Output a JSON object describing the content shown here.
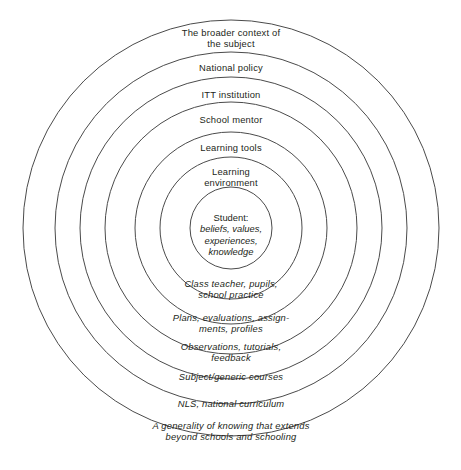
{
  "diagram": {
    "type": "concentric-circles",
    "stroke_color": "#4b4b4b",
    "text_color": "#231f20",
    "background_color": "#ffffff",
    "center": {
      "x": 231,
      "y": 228
    },
    "core": {
      "title": "Student:",
      "detail": "beliefs, values,\nexperiences,\nknowledge",
      "radius": 41,
      "label_x": 231,
      "label_y": 212
    },
    "rings": [
      {
        "index": 1,
        "radius": 71,
        "top_label": "Learning\nenvironment",
        "bottom_label": "Class teacher, pupils,\nschool practice",
        "top_x": 231,
        "top_y": 166,
        "bottom_x": 231,
        "bottom_y": 278
      },
      {
        "index": 2,
        "radius": 96,
        "top_label": "Learning tools",
        "bottom_label": "Plans, evaluations, assign-\nments, profiles",
        "top_x": 231,
        "top_y": 142,
        "bottom_x": 231,
        "bottom_y": 312
      },
      {
        "index": 3,
        "radius": 126,
        "top_label": "School mentor",
        "bottom_label": "Observations, tutorials,\nfeedback",
        "top_x": 231,
        "top_y": 114,
        "bottom_x": 231,
        "bottom_y": 341
      },
      {
        "index": 4,
        "radius": 151,
        "top_label": "ITT institution",
        "bottom_label": "Subject/generic courses",
        "top_x": 231,
        "top_y": 89,
        "bottom_x": 231,
        "bottom_y": 371
      },
      {
        "index": 5,
        "radius": 176,
        "top_label": "National policy",
        "bottom_label": "NLS, national curriculum",
        "top_x": 231,
        "top_y": 62,
        "bottom_x": 231,
        "bottom_y": 398
      },
      {
        "index": 6,
        "radius": 208,
        "top_label": "The broader context of\nthe subject",
        "bottom_label": "A generality of knowing that extends\nbeyond schools and schooling",
        "top_x": 231,
        "top_y": 27,
        "bottom_x": 231,
        "bottom_y": 420
      }
    ]
  }
}
